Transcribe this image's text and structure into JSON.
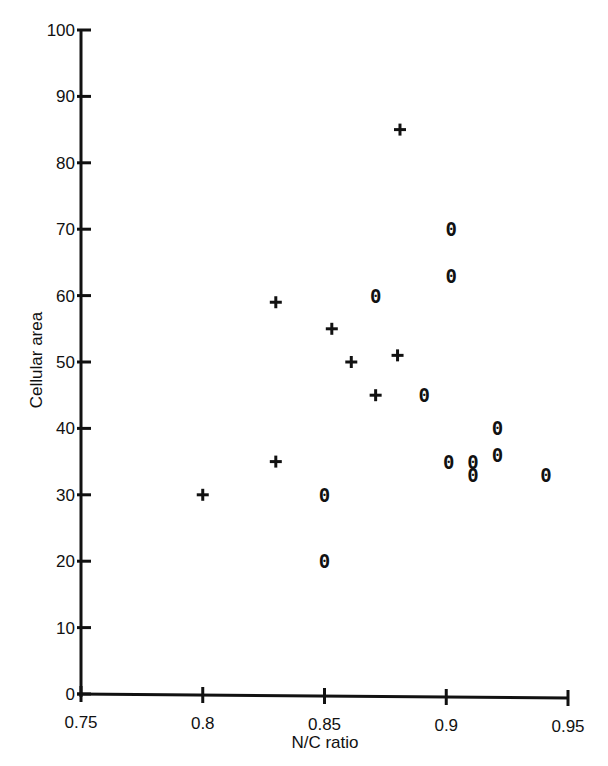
{
  "chart_data": {
    "type": "scatter",
    "title": "",
    "xlabel": "N/C ratio",
    "ylabel": "Cellular area",
    "xlim": [
      0.75,
      0.95
    ],
    "ylim": [
      0,
      100
    ],
    "grid": false,
    "legend": null,
    "x_ticks": [
      "0.75",
      "0.8",
      "0.85",
      "0.9",
      "0.95"
    ],
    "y_ticks": [
      "0",
      "10",
      "20",
      "30",
      "40",
      "50",
      "60",
      "70",
      "80",
      "90",
      "100"
    ],
    "series": [
      {
        "name": "+",
        "marker": "plus",
        "points": [
          {
            "x": 0.8,
            "y": 30
          },
          {
            "x": 0.83,
            "y": 35
          },
          {
            "x": 0.83,
            "y": 59
          },
          {
            "x": 0.853,
            "y": 55
          },
          {
            "x": 0.861,
            "y": 50
          },
          {
            "x": 0.871,
            "y": 45
          },
          {
            "x": 0.88,
            "y": 51
          },
          {
            "x": 0.881,
            "y": 85
          }
        ]
      },
      {
        "name": "o",
        "marker": "o",
        "points": [
          {
            "x": 0.85,
            "y": 30
          },
          {
            "x": 0.85,
            "y": 20
          },
          {
            "x": 0.871,
            "y": 60
          },
          {
            "x": 0.891,
            "y": 45
          },
          {
            "x": 0.902,
            "y": 70
          },
          {
            "x": 0.902,
            "y": 63
          },
          {
            "x": 0.901,
            "y": 35
          },
          {
            "x": 0.911,
            "y": 35
          },
          {
            "x": 0.911,
            "y": 33
          },
          {
            "x": 0.921,
            "y": 40
          },
          {
            "x": 0.921,
            "y": 36
          },
          {
            "x": 0.941,
            "y": 33
          }
        ]
      }
    ]
  }
}
